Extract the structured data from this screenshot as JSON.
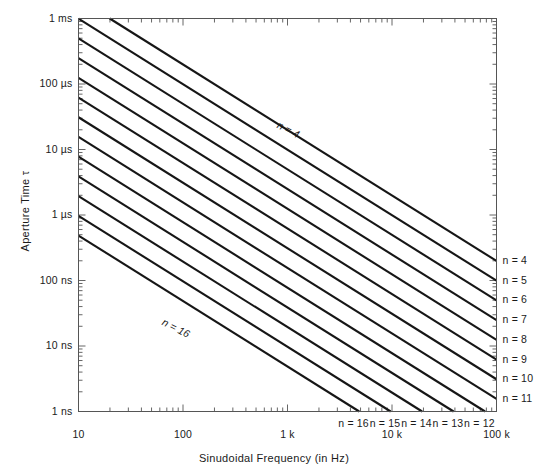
{
  "chart_data": {
    "type": "line",
    "title": "",
    "xlabel": "Sinudoidal Frequency (in Hz)",
    "ylabel": "Aperture Time τ",
    "xscale": "log",
    "yscale": "log",
    "xlim": [
      10,
      100000
    ],
    "ylim": [
      1e-09,
      0.001
    ],
    "grid": false,
    "legend": "right-edge-and-bottom-edge line labels",
    "xticks": [
      {
        "value": 10,
        "label": "10"
      },
      {
        "value": 100,
        "label": "100"
      },
      {
        "value": 1000,
        "label": "1 k"
      },
      {
        "value": 10000,
        "label": "10 k"
      },
      {
        "value": 100000,
        "label": "100 k"
      }
    ],
    "yticks": [
      {
        "value": 0.001,
        "label": "1 ms"
      },
      {
        "value": 0.0001,
        "label": "100 µs"
      },
      {
        "value": 1e-05,
        "label": "10 µs"
      },
      {
        "value": 1e-06,
        "label": "1 µs"
      },
      {
        "value": 1e-07,
        "label": "100 ns"
      },
      {
        "value": 1e-08,
        "label": "10 ns"
      },
      {
        "value": 1e-09,
        "label": "1 ns"
      }
    ],
    "relation": "tau = 1 / (2^n * pi * f)",
    "series": [
      {
        "name": "n = 4",
        "n": 4,
        "tau_at_10Hz": 0.0009947,
        "tau_at_100kHz": 9.947e-08
      },
      {
        "name": "n = 5",
        "n": 5,
        "tau_at_10Hz": 0.0004974,
        "tau_at_100kHz": 4.974e-08
      },
      {
        "name": "n = 6",
        "n": 6,
        "tau_at_10Hz": 0.0002487,
        "tau_at_100kHz": 2.487e-08
      },
      {
        "name": "n = 7",
        "n": 7,
        "tau_at_10Hz": 0.0001243,
        "tau_at_100kHz": 1.243e-08
      },
      {
        "name": "n = 8",
        "n": 8,
        "tau_at_10Hz": 6.217e-05,
        "tau_at_100kHz": 6.217e-09
      },
      {
        "name": "n = 9",
        "n": 9,
        "tau_at_10Hz": 3.109e-05,
        "tau_at_100kHz": 3.109e-09
      },
      {
        "name": "n = 10",
        "n": 10,
        "tau_at_10Hz": 1.554e-05,
        "tau_at_100kHz": 1.554e-09
      },
      {
        "name": "n = 11",
        "n": 11,
        "tau_at_10Hz": 7.772e-06,
        "tau_at_100kHz": 1e-09
      },
      {
        "name": "n = 12",
        "n": 12,
        "tau_at_10Hz": 3.886e-06,
        "tau_at_100kHz": 1e-09
      },
      {
        "name": "n = 13",
        "n": 13,
        "tau_at_10Hz": 1.943e-06,
        "tau_at_100kHz": 1e-09
      },
      {
        "name": "n = 14",
        "n": 14,
        "tau_at_10Hz": 9.715e-07,
        "tau_at_100kHz": 1e-09
      },
      {
        "name": "n = 15",
        "n": 15,
        "tau_at_10Hz": 4.857e-07,
        "tau_at_100kHz": 1e-09
      },
      {
        "name": "n = 16",
        "n": 16,
        "tau_at_10Hz": 2.429e-07,
        "tau_at_100kHz": 1e-09
      }
    ],
    "right_edge_labels": [
      "n = 4",
      "n = 5",
      "n = 6",
      "n = 7",
      "n = 8",
      "n = 9",
      "n = 10",
      "n = 11"
    ],
    "bottom_edge_labels": [
      "n = 16",
      "n = 15",
      "n = 14",
      "n = 13",
      "n = 12"
    ],
    "inline_annotations": [
      {
        "text": "n = 4",
        "rotated": true
      },
      {
        "text": "n = 16",
        "rotated": true
      }
    ],
    "colors": {
      "line": "#161616",
      "axis": "#4a4a4a",
      "text": "#1a1a1a",
      "background": "#ffffff"
    }
  }
}
